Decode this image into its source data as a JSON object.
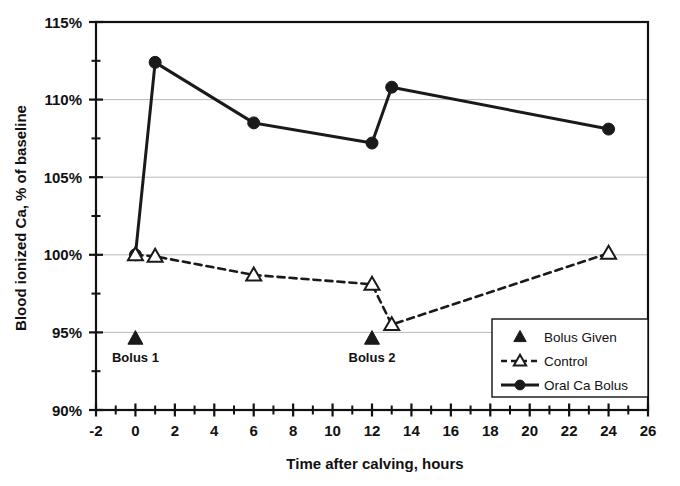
{
  "chart_data": {
    "type": "line",
    "title": "",
    "xlabel": "Time after calving, hours",
    "ylabel": "Blood ionized Ca, % of baseline",
    "xlim": [
      -2,
      26
    ],
    "ylim": [
      90,
      115
    ],
    "x_major_step": 2,
    "x_minor_step": 1,
    "y_major_step": 5,
    "y_minor_step": 2.5,
    "grid": "horizontal-major-only",
    "legend_position": "inside-bottom-right",
    "x_tick_labels": [
      "-2",
      "0",
      "2",
      "4",
      "6",
      "8",
      "10",
      "12",
      "14",
      "16",
      "18",
      "20",
      "22",
      "24",
      "26"
    ],
    "x_tick_values": [
      -2,
      0,
      2,
      4,
      6,
      8,
      10,
      12,
      14,
      16,
      18,
      20,
      22,
      24,
      26
    ],
    "y_tick_labels": [
      "90%",
      "95%",
      "100%",
      "105%",
      "110%",
      "115%"
    ],
    "y_tick_values": [
      90,
      95,
      100,
      105,
      110,
      115
    ],
    "series": [
      {
        "name": "Oral Ca Bolus",
        "marker": "filled-circle",
        "line": "solid",
        "color": "#1a1a1a",
        "x": [
          0,
          1,
          6,
          12,
          13,
          24
        ],
        "values": [
          100.0,
          112.4,
          108.5,
          107.2,
          110.8,
          108.1
        ]
      },
      {
        "name": "Control",
        "marker": "open-triangle",
        "line": "dashed",
        "color": "#1a1a1a",
        "x": [
          0,
          1,
          6,
          12,
          13,
          24
        ],
        "values": [
          100.0,
          99.9,
          98.7,
          98.1,
          95.5,
          100.1
        ]
      },
      {
        "name": "Bolus Given",
        "marker": "filled-triangle",
        "line": "none",
        "color": "#1a1a1a",
        "x": [
          0,
          12
        ],
        "values": [
          94.6,
          94.6
        ]
      }
    ],
    "annotations": [
      {
        "label": "Bolus 1",
        "x": 0,
        "y": 93.1
      },
      {
        "label": "Bolus 2",
        "x": 12,
        "y": 93.1
      }
    ],
    "legend": [
      {
        "label": "Bolus Given",
        "marker": "filled-triangle",
        "line": "none"
      },
      {
        "label": "Control",
        "marker": "open-triangle",
        "line": "dashed"
      },
      {
        "label": "Oral Ca Bolus",
        "marker": "filled-circle",
        "line": "solid"
      }
    ]
  },
  "axes": {
    "y_title": "Blood ionized Ca, % of baseline",
    "x_title": "Time after calving, hours"
  }
}
